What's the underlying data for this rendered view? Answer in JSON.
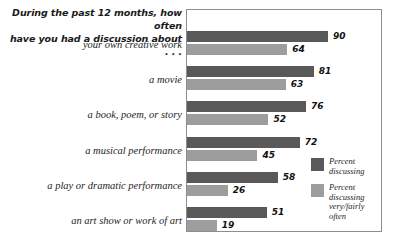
{
  "chart_data": {
    "type": "bar",
    "orientation": "horizontal",
    "title": "During the past 12 months, how often\nhave you had a discussion about . . .",
    "xlabel": "",
    "ylabel": "",
    "xlim": [
      0,
      100
    ],
    "grid": false,
    "legend_position": "inside-bottom-right",
    "categories": [
      "your own creative work",
      "a movie",
      "a book, poem, or story",
      "a musical performance",
      "a play or dramatic performance",
      "an art show or work of art"
    ],
    "series": [
      {
        "name": "Percent\ndiscussing",
        "color": "#595959",
        "values": [
          90,
          81,
          76,
          72,
          58,
          51
        ]
      },
      {
        "name": "Percent\ndiscussing\nvery/fairly\noften",
        "color": "#9d9d9d",
        "values": [
          64,
          63,
          52,
          45,
          26,
          19
        ]
      }
    ]
  },
  "colors": {
    "series_dark": "#595959",
    "series_light": "#9d9d9d",
    "plot_border": "#8d8d8d",
    "text": "#1e1e1e",
    "background": "#ffffff"
  }
}
